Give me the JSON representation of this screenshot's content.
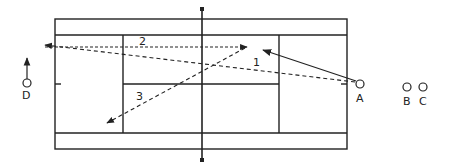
{
  "diagram": {
    "colors": {
      "line": "#222222",
      "background": "#ffffff"
    },
    "players": [
      {
        "id": "A",
        "label": "A",
        "x": 360,
        "y": 84
      },
      {
        "id": "B",
        "label": "B",
        "x": 407,
        "y": 87
      },
      {
        "id": "C",
        "label": "C",
        "x": 423,
        "y": 87
      },
      {
        "id": "D",
        "label": "D",
        "x": 25,
        "y": 83
      }
    ],
    "shots": [
      {
        "id": "1",
        "label": "1",
        "style": "dashed",
        "from": [
          358,
          83
        ],
        "to": [
          43,
          44
        ]
      },
      {
        "id": "2",
        "label": "2",
        "style": "dashed",
        "from": [
          43,
          47
        ],
        "to": [
          245,
          47
        ]
      },
      {
        "id": "3",
        "label": "3",
        "style": "dashed",
        "from": [
          245,
          48
        ],
        "to": [
          106,
          124
        ]
      },
      {
        "id": "return",
        "label": "",
        "style": "solid",
        "from": [
          358,
          82
        ],
        "to": [
          262,
          50
        ]
      }
    ],
    "movement": {
      "player": "D",
      "direction": "up"
    }
  }
}
